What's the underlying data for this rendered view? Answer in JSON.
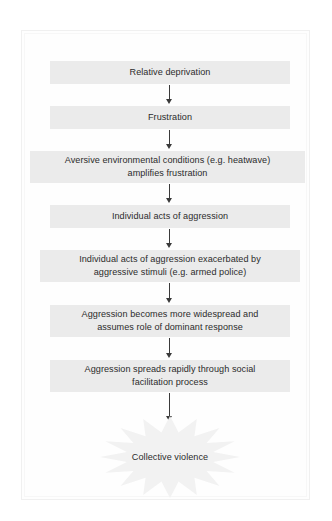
{
  "figure": {
    "type": "flowchart",
    "orientation": "vertical",
    "background_color": "#ffffff",
    "frame_color": "#f0f0f0",
    "node_fill_color": "#ebebeb",
    "text_color": "#2b2b2b",
    "arrow_color": "#3a3a3a",
    "burst_color": "#f2f2f2"
  },
  "nodes": [
    {
      "id": "relative-deprivation",
      "label": "Relative deprivation"
    },
    {
      "id": "frustration",
      "label": "Frustration"
    },
    {
      "id": "aversive-conditions",
      "label": "Aversive environmental conditions (e.g. heatwave)\namplifies frustration"
    },
    {
      "id": "individual-acts",
      "label": "Individual acts of aggression"
    },
    {
      "id": "individual-acts-exacerbated",
      "label": "Individual acts of aggression exacerbated by\naggressive stimuli (e.g. armed police)"
    },
    {
      "id": "aggression-widespread",
      "label": "Aggression becomes more widespread and\nassumes role of dominant response"
    },
    {
      "id": "aggression-spreads",
      "label": "Aggression spreads rapidly through social\nfacilitation process"
    }
  ],
  "terminal": {
    "id": "collective-violence",
    "label": "Collective violence",
    "shape": "starburst"
  },
  "arrows": [
    {
      "from": "relative-deprivation",
      "to": "frustration",
      "glyph": "down-arrow"
    },
    {
      "from": "frustration",
      "to": "aversive-conditions",
      "glyph": "down-arrow"
    },
    {
      "from": "aversive-conditions",
      "to": "individual-acts",
      "glyph": "down-arrow"
    },
    {
      "from": "individual-acts",
      "to": "individual-acts-exacerbated",
      "glyph": "down-arrow"
    },
    {
      "from": "individual-acts-exacerbated",
      "to": "aggression-widespread",
      "glyph": "down-arrow"
    },
    {
      "from": "aggression-widespread",
      "to": "aggression-spreads",
      "glyph": "down-arrow"
    },
    {
      "from": "aggression-spreads",
      "to": "collective-violence",
      "glyph": "down-arrow"
    }
  ]
}
